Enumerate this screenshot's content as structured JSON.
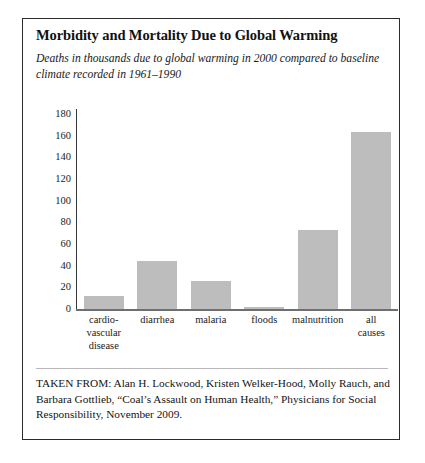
{
  "figure": {
    "title": "Morbidity and Mortality Due to Global Warming",
    "subtitle": "Deaths in thousands due to global warming in 2000 compared to baseline climate recorded in 1961–1990",
    "citation": "TAKEN FROM: Alan H. Lockwood, Kristen Welker-Hood, Molly Rauch, and Barbara Gottlieb, “Coal’s Assault on Human Health,” Physicians for Social Responsibility, November 2009.",
    "bar_color": "#bdbdbd",
    "axis_color": "#3a3a3a",
    "border_color": "#2b2b2b"
  },
  "chart_data": {
    "type": "bar",
    "title": "Morbidity and Mortality Due to Global Warming",
    "subtitle": "Deaths in thousands due to global warming in 2000 compared to baseline climate recorded in 1961–1990",
    "xlabel": "",
    "ylabel": "",
    "ylim": [
      0,
      180
    ],
    "yticks": [
      0,
      20,
      40,
      60,
      80,
      100,
      120,
      140,
      160,
      180
    ],
    "ytick_labels": [
      "0",
      "20",
      "40",
      "60",
      "80",
      "100",
      "120",
      "140",
      "160",
      "180"
    ],
    "grid": false,
    "legend": false,
    "categories": [
      "cardio-vascular disease",
      "diarrhea",
      "malaria",
      "floods",
      "malnutrition",
      "all causes"
    ],
    "category_lines": [
      [
        "cardio-",
        "vascular",
        "disease"
      ],
      [
        "diarrhea"
      ],
      [
        "malaria"
      ],
      [
        "floods"
      ],
      [
        "malnutrition"
      ],
      [
        "all",
        "causes"
      ]
    ],
    "values": [
      12,
      44,
      26,
      2,
      73,
      163
    ],
    "units": "thousands of deaths"
  }
}
